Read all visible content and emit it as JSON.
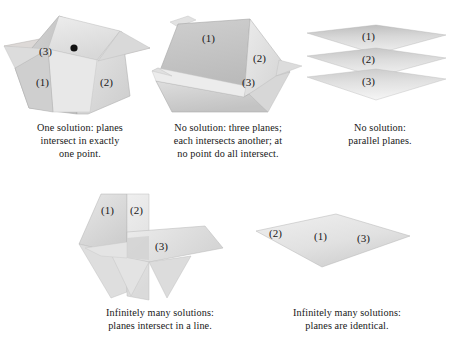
{
  "figure": {
    "plane_label_prefix": "(",
    "colors": {
      "plane_light": "#e6e6e6",
      "plane_mid": "#d2d2d2",
      "plane_dark": "#bcbcbc",
      "plane_darker": "#ababab",
      "edge": "#9a9a9a",
      "point_marker": "#101010",
      "text": "#181818",
      "background": "#ffffff"
    }
  },
  "panels": [
    {
      "id": "point",
      "name": "one-solution-point",
      "plane_labels": [
        "(1)",
        "(2)",
        "(3)"
      ],
      "marker": "intersection-point",
      "caption": [
        "One solution: planes",
        "intersect in exactly",
        "one point."
      ]
    },
    {
      "id": "triangle",
      "name": "no-solution-triangular-prism",
      "plane_labels": [
        "(1)",
        "(2)",
        "(3)"
      ],
      "caption": [
        "No solution: three planes;",
        "each intersects another; at",
        "no point do all intersect."
      ]
    },
    {
      "id": "parallel",
      "name": "no-solution-parallel-planes",
      "plane_labels": [
        "(1)",
        "(2)",
        "(3)"
      ],
      "caption": [
        "No solution:",
        "parallel planes."
      ]
    },
    {
      "id": "line",
      "name": "infinite-solutions-common-line",
      "plane_labels": [
        "(1)",
        "(2)",
        "(3)"
      ],
      "caption": [
        "Infinitely many solutions:",
        "planes intersect in a line."
      ]
    },
    {
      "id": "identical",
      "name": "infinite-solutions-identical-planes",
      "plane_labels": [
        "(2)",
        "(1)",
        "(3)"
      ],
      "caption": [
        "Infinitely many solutions:",
        "planes are identical."
      ]
    }
  ]
}
